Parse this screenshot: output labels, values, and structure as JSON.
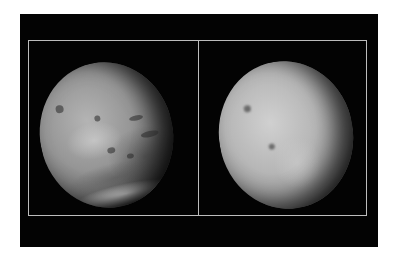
{
  "image": {
    "description": "Two side-by-side grayscale views of a planet (Mars-like) inside a framed black panel",
    "panels": [
      {
        "name": "left-view",
        "subject": "planet with dark surface markings, craters and bright southern polar cap"
      },
      {
        "name": "right-view",
        "subject": "planet with hazy bright disk and two small dark spots"
      }
    ],
    "colors": {
      "background": "#ffffff",
      "panel": "#030303",
      "frame": "#bdbdbd"
    }
  }
}
